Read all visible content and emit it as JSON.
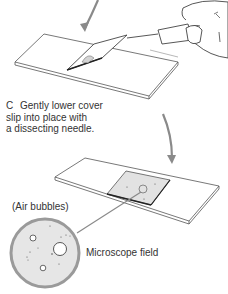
{
  "step_c": {
    "letter": "C",
    "line1": "Gently lower cover",
    "line2": "slip into place with",
    "line3": "a dissecting needle."
  },
  "labels": {
    "air_bubbles": "(Air bubbles)",
    "microscope_field": "Microscope field"
  },
  "colors": {
    "arrow": "#8a8a8a",
    "outline": "#444444",
    "coverslip_fill": "#e2e2e2",
    "field_fill": "#e6e6e6",
    "field_ring": "#9a9a9a"
  }
}
